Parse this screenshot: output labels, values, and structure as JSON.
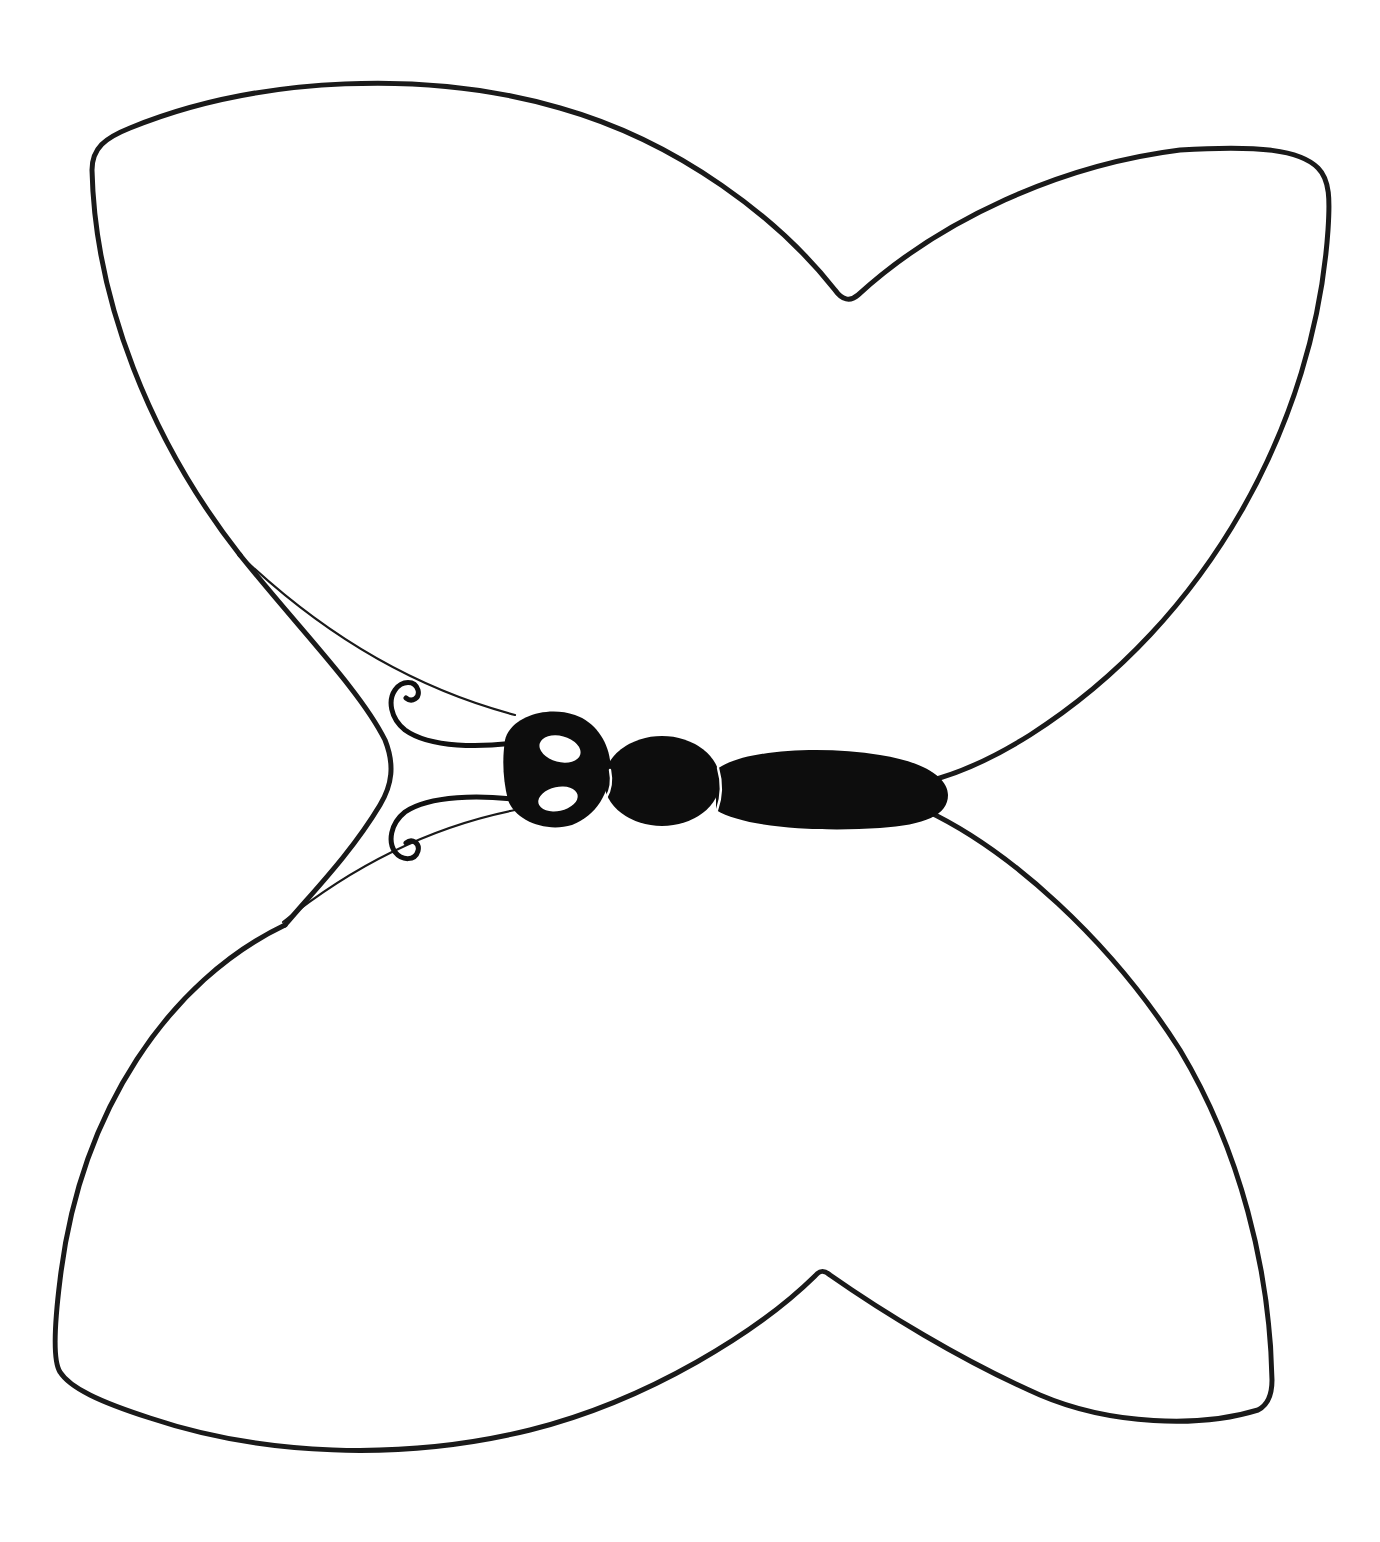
{
  "image": {
    "subject": "butterfly outline line drawing",
    "width": 1380,
    "height": 1542,
    "background": "#ffffff",
    "line_color": "#1a1a1a",
    "body_color": "#0d0d0d"
  },
  "parts": {
    "upper_wing": "upper-wing-outline",
    "lower_wing": "lower-wing-outline",
    "head": "head",
    "thorax": "thorax",
    "abdomen": "abdomen",
    "antennae": [
      "upper-antenna",
      "lower-antenna"
    ],
    "eyes": [
      "upper-eye",
      "lower-eye"
    ]
  }
}
